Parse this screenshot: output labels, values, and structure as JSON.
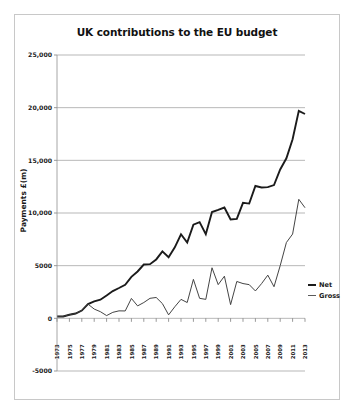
{
  "figure": {
    "title": "UK contributions to the EU budget",
    "ylabel": "Payments £(m)"
  },
  "legend": {
    "net_label": "Net",
    "gross_label": "Gross",
    "net_color": "#1b1b1b",
    "gross_color": "#5a5a5a"
  },
  "chart_data": {
    "type": "line",
    "title": "UK contributions to the EU budget",
    "xlabel": "",
    "ylabel": "Payments £(m)",
    "ylim": [
      -5000,
      25000
    ],
    "yticks": [
      -5000,
      0,
      5000,
      10000,
      15000,
      20000,
      25000
    ],
    "ytick_labels": [
      "-5000",
      "0",
      "5000",
      "10,000",
      "15,000",
      "20,000",
      "25,000"
    ],
    "grid": true,
    "legend_position": "right",
    "x": [
      1973,
      1974,
      1975,
      1976,
      1977,
      1978,
      1979,
      1980,
      1981,
      1982,
      1983,
      1984,
      1985,
      1986,
      1987,
      1988,
      1989,
      1990,
      1991,
      1992,
      1993,
      1994,
      1995,
      1996,
      1997,
      1998,
      1999,
      2000,
      2001,
      2002,
      2003,
      2004,
      2005,
      2006,
      2007,
      2008,
      2009,
      2010,
      2011,
      2012,
      2013
    ],
    "xtick_labels": [
      "1973",
      "1975",
      "1977",
      "1979",
      "1981",
      "1983",
      "1985",
      "1987",
      "1989",
      "1991",
      "1993",
      "1995",
      "1997",
      "1999",
      "2001",
      "2003",
      "2005",
      "2007",
      "2009",
      "2011",
      "2013"
    ],
    "xtick_values": [
      1973,
      1975,
      1977,
      1979,
      1981,
      1983,
      1985,
      1987,
      1989,
      1991,
      1993,
      1995,
      1997,
      1999,
      2001,
      2003,
      2005,
      2007,
      2009,
      2011,
      2013
    ],
    "series": [
      {
        "name": "Gross",
        "color": "#1b1b1b",
        "values": [
          180,
          180,
          340,
          460,
          740,
          1350,
          1610,
          1770,
          2170,
          2590,
          2880,
          3190,
          3940,
          4450,
          5110,
          5140,
          5590,
          6355,
          5800,
          6740,
          7985,
          7190,
          8890,
          9130,
          7991,
          10090,
          10287,
          10517,
          9379,
          9439,
          10966,
          10895,
          12567,
          12426,
          12456,
          12653,
          14129,
          15197,
          17000,
          19700,
          19400
        ]
      },
      {
        "name": "Net",
        "color": "#3a3a3a",
        "values": [
          180,
          180,
          340,
          460,
          740,
          1350,
          880,
          630,
          260,
          570,
          710,
          700,
          1890,
          1180,
          1500,
          1900,
          1980,
          1400,
          330,
          1100,
          1800,
          1500,
          3700,
          1900,
          1800,
          4800,
          3200,
          4000,
          1300,
          3500,
          3300,
          3200,
          2600,
          3300,
          4100,
          3000,
          5000,
          7200,
          8000,
          11300,
          10500
        ]
      }
    ]
  }
}
